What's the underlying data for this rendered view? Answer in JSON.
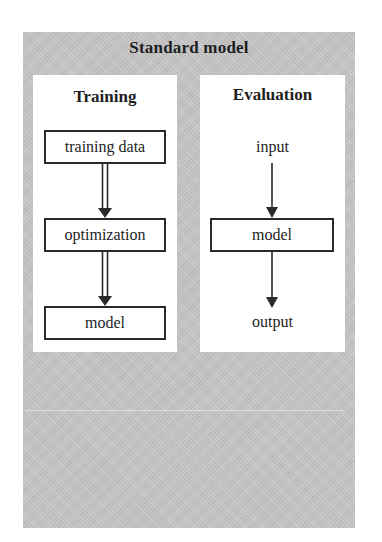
{
  "diagram": {
    "title": "Standard model",
    "panels": [
      {
        "title": "Training",
        "nodes": [
          {
            "label": "training data",
            "shape": "box"
          },
          {
            "label": "optimization",
            "shape": "box"
          },
          {
            "label": "model",
            "shape": "box"
          }
        ],
        "edges": [
          {
            "from": "training data",
            "to": "optimization",
            "style": "double-arrow"
          },
          {
            "from": "optimization",
            "to": "model",
            "style": "double-arrow"
          }
        ]
      },
      {
        "title": "Evaluation",
        "nodes": [
          {
            "label": "input",
            "shape": "text"
          },
          {
            "label": "model",
            "shape": "box"
          },
          {
            "label": "output",
            "shape": "text"
          }
        ],
        "edges": [
          {
            "from": "input",
            "to": "model",
            "style": "single-arrow"
          },
          {
            "from": "model",
            "to": "output",
            "style": "single-arrow"
          }
        ]
      }
    ]
  },
  "colors": {
    "outer_background": "#c4c4c4",
    "panel_background": "#ffffff",
    "stroke": "#2a2a2a"
  }
}
